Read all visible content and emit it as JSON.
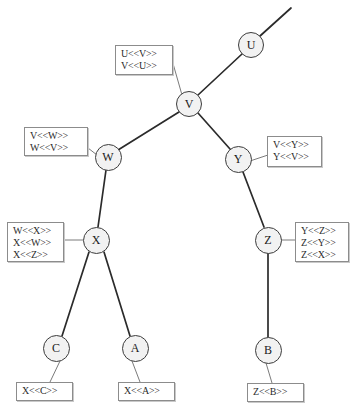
{
  "diagram": {
    "type": "node-link-tree",
    "canvas": {
      "width": 353,
      "height": 412,
      "background": "#ffffff"
    },
    "style": {
      "node_fill": "#f2f2f2",
      "node_stroke": "#3c3c3c",
      "edge_color": "#2b2b2b",
      "label_box_border": "#8c8c8c",
      "label_box_fill": "#ffffff",
      "label_text_color": "#2b2b2b"
    },
    "nodes": [
      {
        "id": "U",
        "label": "U",
        "cx": 251,
        "cy": 45,
        "r": 13
      },
      {
        "id": "V",
        "label": "V",
        "cx": 189,
        "cy": 104,
        "r": 13
      },
      {
        "id": "W",
        "label": "W",
        "cx": 108,
        "cy": 157,
        "r": 13.5
      },
      {
        "id": "Y",
        "label": "Y",
        "cx": 238,
        "cy": 159,
        "r": 13.5
      },
      {
        "id": "X",
        "label": "X",
        "cx": 96,
        "cy": 240,
        "r": 13.5
      },
      {
        "id": "Z",
        "label": "Z",
        "cx": 268,
        "cy": 240,
        "r": 13.5
      },
      {
        "id": "C",
        "label": "C",
        "cx": 56,
        "cy": 348,
        "r": 13.5
      },
      {
        "id": "A",
        "label": "A",
        "cx": 135,
        "cy": 348,
        "r": 13.5
      },
      {
        "id": "B",
        "label": "B",
        "cx": 268,
        "cy": 350,
        "r": 13.5
      }
    ],
    "edges": [
      {
        "from": "U",
        "to": "open-top-right",
        "x1": 260,
        "y1": 36,
        "x2": 291,
        "y2": 8
      },
      {
        "from": "U",
        "to": "V",
        "x1": 242,
        "y1": 54,
        "x2": 198,
        "y2": 95
      },
      {
        "from": "V",
        "to": "W",
        "x1": 179,
        "y1": 112,
        "x2": 118,
        "y2": 150
      },
      {
        "from": "V",
        "to": "Y",
        "x1": 198,
        "y1": 113,
        "x2": 230,
        "y2": 149
      },
      {
        "from": "W",
        "to": "X",
        "x1": 106,
        "y1": 170,
        "x2": 98,
        "y2": 227
      },
      {
        "from": "Y",
        "to": "Z",
        "x1": 243,
        "y1": 172,
        "x2": 264,
        "y2": 227
      },
      {
        "from": "X",
        "to": "C",
        "x1": 89,
        "y1": 252,
        "x2": 62,
        "y2": 336
      },
      {
        "from": "X",
        "to": "A",
        "x1": 104,
        "y1": 252,
        "x2": 130,
        "y2": 336
      },
      {
        "from": "Z",
        "to": "B",
        "x1": 268,
        "y1": 253,
        "x2": 268,
        "y2": 337
      }
    ],
    "leaders": [
      {
        "from": "label-uv",
        "x1": 172,
        "y1": 60,
        "x2": 182,
        "y2": 95
      },
      {
        "from": "label-vw",
        "x1": 88,
        "y1": 148,
        "x2": 97,
        "y2": 155
      },
      {
        "from": "label-vy",
        "x1": 268,
        "y1": 155,
        "x2": 250,
        "y2": 161
      },
      {
        "from": "label-wx",
        "x1": 63,
        "y1": 240,
        "x2": 83,
        "y2": 240
      },
      {
        "from": "label-yz",
        "x1": 296,
        "y1": 240,
        "x2": 281,
        "y2": 240
      },
      {
        "from": "label-xc",
        "x1": 50,
        "y1": 382,
        "x2": 60,
        "y2": 361
      },
      {
        "from": "label-xa",
        "x1": 140,
        "y1": 382,
        "x2": 132,
        "y2": 361
      },
      {
        "from": "label-zb",
        "x1": 272,
        "y1": 383,
        "x2": 266,
        "y2": 363
      }
    ],
    "labels": [
      {
        "id": "label-uv",
        "attached_to": "V",
        "x": 115,
        "y": 45,
        "width": 58,
        "height": 30,
        "lines": [
          "U<<V>>",
          "V<<U>>"
        ]
      },
      {
        "id": "label-vw",
        "attached_to": "W",
        "x": 24,
        "y": 127,
        "width": 64,
        "height": 29,
        "lines": [
          "V<<W>>",
          "W<<V>>"
        ]
      },
      {
        "id": "label-vy",
        "attached_to": "Y",
        "x": 267,
        "y": 136,
        "width": 55,
        "height": 31,
        "lines": [
          "V<<Y>>",
          "Y<<V>>"
        ]
      },
      {
        "id": "label-wx",
        "attached_to": "X",
        "x": 7,
        "y": 222,
        "width": 57,
        "height": 40,
        "lines": [
          "W<<X>>",
          "X<<W>>",
          "X<<Z>>"
        ]
      },
      {
        "id": "label-yz",
        "attached_to": "Z",
        "x": 295,
        "y": 222,
        "width": 54,
        "height": 40,
        "lines": [
          "Y<<Z>>",
          "Z<<Y>>",
          "Z<<X>>"
        ]
      },
      {
        "id": "label-xc",
        "attached_to": "C",
        "x": 16,
        "y": 382,
        "width": 57,
        "height": 19,
        "lines": [
          "X<<C>>"
        ]
      },
      {
        "id": "label-xa",
        "attached_to": "A",
        "x": 118,
        "y": 382,
        "width": 57,
        "height": 19,
        "lines": [
          "X<<A>>"
        ]
      },
      {
        "id": "label-zb",
        "attached_to": "B",
        "x": 247,
        "y": 383,
        "width": 57,
        "height": 19,
        "lines": [
          "Z<<B>>"
        ]
      }
    ]
  }
}
